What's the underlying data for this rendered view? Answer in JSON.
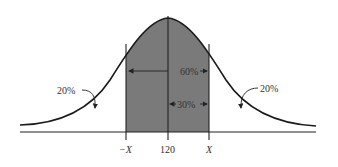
{
  "diagram": {
    "type": "normal-distribution",
    "mean_label": "120",
    "left_bound_label": "−X",
    "right_bound_label": "X",
    "shaded_region_label": "60%",
    "half_shaded_label": "30%",
    "left_tail_label": "20%",
    "right_tail_label": "20%",
    "colors": {
      "shade": "#7a7a7a",
      "curve": "#1a1a1a",
      "background": "#ffffff"
    }
  }
}
